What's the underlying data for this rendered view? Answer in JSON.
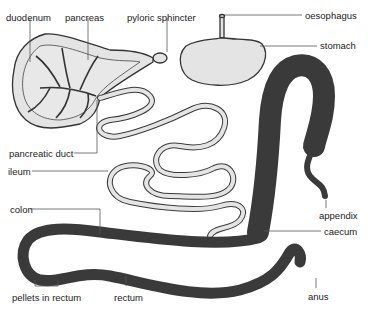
{
  "diagram": {
    "colors": {
      "organ_fill": "#e4e4e4",
      "outline": "#333333",
      "leader_line": "#555555",
      "label_text": "#222222",
      "background": "#ffffff"
    },
    "labels": [
      {
        "id": "duodenum",
        "text": "duodenum",
        "x": 6,
        "y": 12
      },
      {
        "id": "pancreas",
        "text": "pancreas",
        "x": 65,
        "y": 12
      },
      {
        "id": "pyloric_sphincter",
        "text": "pyloric sphincter",
        "x": 127,
        "y": 12
      },
      {
        "id": "oesophagus",
        "text": "oesophagus",
        "x": 305,
        "y": 10
      },
      {
        "id": "stomach",
        "text": "stomach",
        "x": 320,
        "y": 40
      },
      {
        "id": "pancreatic_duct",
        "text": "pancreatic duct",
        "x": 9,
        "y": 148
      },
      {
        "id": "ileum",
        "text": "ileum",
        "x": 8,
        "y": 166
      },
      {
        "id": "colon",
        "text": "colon",
        "x": 10,
        "y": 204
      },
      {
        "id": "appendix",
        "text": "appendix",
        "x": 319,
        "y": 210
      },
      {
        "id": "caecum",
        "text": "caecum",
        "x": 324,
        "y": 226
      },
      {
        "id": "pellets_in_rectum",
        "text": "pellets in rectum",
        "x": 12,
        "y": 292
      },
      {
        "id": "rectum",
        "text": "rectum",
        "x": 114,
        "y": 292
      },
      {
        "id": "anus",
        "text": "anus",
        "x": 308,
        "y": 291
      }
    ]
  }
}
